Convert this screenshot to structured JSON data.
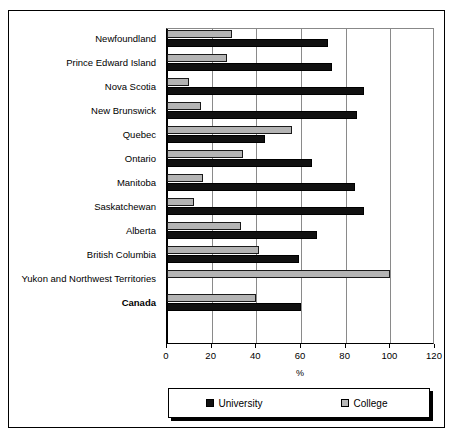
{
  "chart_data": {
    "type": "bar",
    "orientation": "horizontal",
    "title": "",
    "xlabel": "%",
    "ylabel": "",
    "xlim": [
      0,
      120
    ],
    "xticks": [
      0,
      20,
      40,
      60,
      80,
      100,
      120
    ],
    "xticklabels": [
      "0",
      "20",
      "40",
      "60",
      "80",
      "100",
      "120"
    ],
    "grid": true,
    "legend_position": "bottom",
    "categories": [
      "Newfoundland",
      "Prince Edward Island",
      "Nova Scotia",
      "New Brunswick",
      "Quebec",
      "Ontario",
      "Manitoba",
      "Saskatchewan",
      "Alberta",
      "British Columbia",
      "Yukon and Northwest Territories",
      "Canada"
    ],
    "emphasized_categories": [
      "Canada"
    ],
    "series": [
      {
        "name": "University",
        "color": "#111111",
        "values": [
          72,
          74,
          88,
          85,
          44,
          65,
          84,
          88,
          67,
          59,
          0,
          60
        ]
      },
      {
        "name": "College",
        "color": "#b4b4b4",
        "values": [
          29,
          27,
          10,
          15,
          56,
          34,
          16,
          12,
          33,
          41,
          100,
          40
        ]
      }
    ]
  },
  "legend": {
    "items": [
      {
        "label": "University",
        "swatch": "university"
      },
      {
        "label": "College",
        "swatch": "college"
      }
    ]
  }
}
